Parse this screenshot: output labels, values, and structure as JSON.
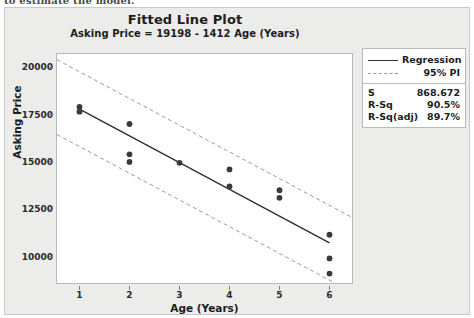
{
  "document_remnant": "to estimate the model.",
  "chart_data": {
    "type": "scatter",
    "title": "Fitted Line Plot",
    "subtitle": "Asking Price = 19198 - 1412 Age (Years)",
    "xlabel": "Age (Years)",
    "ylabel": "Asking Price",
    "xlim": [
      0.55,
      6.45
    ],
    "ylim": [
      8600,
      20700
    ],
    "xticks": [
      1,
      2,
      3,
      4,
      5,
      6
    ],
    "yticks": [
      10000,
      12500,
      15000,
      17500,
      20000
    ],
    "ytick_labels": [
      "10000",
      "12500",
      "15000",
      "17500",
      "20000"
    ],
    "xtick_labels": [
      "1",
      "2",
      "3",
      "4",
      "5",
      "6"
    ],
    "grid": false,
    "legend_position": "right",
    "points": [
      {
        "x": 1,
        "y": 17900
      },
      {
        "x": 1,
        "y": 17650
      },
      {
        "x": 2,
        "y": 17000
      },
      {
        "x": 2,
        "y": 15400
      },
      {
        "x": 2,
        "y": 15000
      },
      {
        "x": 3,
        "y": 14950
      },
      {
        "x": 4,
        "y": 14600
      },
      {
        "x": 4,
        "y": 13700
      },
      {
        "x": 5,
        "y": 13500
      },
      {
        "x": 5,
        "y": 13100
      },
      {
        "x": 6,
        "y": 11150
      },
      {
        "x": 6,
        "y": 9900
      },
      {
        "x": 6,
        "y": 9100
      }
    ],
    "fit": {
      "intercept": 19198,
      "slope": -1412,
      "equation": "Asking Price = 19198 - 1412 Age (Years)"
    },
    "prediction_interval": {
      "label": "95% PI",
      "half_width": 1975
    },
    "series": [
      {
        "name": "Regression",
        "style": "solid",
        "color": "#2f2f2f"
      },
      {
        "name": "95% PI",
        "style": "dashed",
        "color": "#9b9b9b"
      }
    ]
  },
  "legend": {
    "items": [
      {
        "label": "Regression",
        "style": "solid"
      },
      {
        "label": "95% PI",
        "style": "dashed"
      }
    ]
  },
  "stats": {
    "rows": [
      {
        "key": "S",
        "value": "868.672"
      },
      {
        "key": "R-Sq",
        "value": "90.5%"
      },
      {
        "key": "R-Sq(adj)",
        "value": "89.7%"
      }
    ]
  },
  "colors": {
    "panel_background": "#ececeb",
    "plot_background": "#ffffff",
    "regression_line": "#2f2f2f",
    "interval_line": "#9b9b9b",
    "point_fill": "#3a3a3a",
    "frame_border": "#b9b9b7"
  }
}
